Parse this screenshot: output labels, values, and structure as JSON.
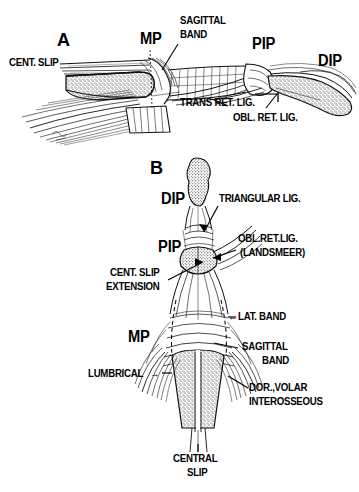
{
  "figure": {
    "background_color": "#ffffff",
    "ink_color": "#000000",
    "style": "black-and-white pen-and-ink anatomical line drawing"
  },
  "panel_a": {
    "letter": "A",
    "view": "lateral view of finger extensor mechanism",
    "labels": {
      "cent_slip": "CENT. SLIP",
      "mp": "MP",
      "sagittal": "SAGITTAL",
      "band": "BAND",
      "pip": "PIP",
      "dip": "DIP",
      "trans_ret_lig": "TRANS RET. LIG.",
      "obl_ret_lig": "OBL. RET. LIG."
    }
  },
  "panel_b": {
    "letter": "B",
    "view": "dorsal view of finger extensor mechanism",
    "labels": {
      "dip": "DIP",
      "triangular_lig": "TRIANGULAR LIG.",
      "pip": "PIP",
      "obl_ret_lig": "OBL.RET.LIG.",
      "landsmeer": "(LANDSMEER)",
      "cent_slip": "CENT. SLIP",
      "extension": "EXTENSION",
      "lat_band": "LAT. BAND",
      "sagittal": "SAGITTAL",
      "band": "BAND",
      "mp": "MP",
      "lumbrical": "LUMBRICAL",
      "dor_volar": "DOR.,VOLAR",
      "interosseous": "INTEROSSEOUS",
      "central": "CENTRAL",
      "slip": "SLIP"
    },
    "arrow_glyphs": {
      "lat_band_arrow": "←",
      "lumbrical_arrow": "→"
    }
  }
}
